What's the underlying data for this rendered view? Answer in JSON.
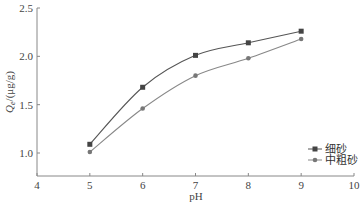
{
  "chart_data": {
    "type": "line",
    "title": "",
    "xlabel": "pH",
    "ylabel": "Q_e/(μg/g)",
    "xlim": [
      4,
      10
    ],
    "ylim": [
      0.75,
      2.5
    ],
    "xticks": [
      4,
      5,
      6,
      7,
      8,
      9,
      10
    ],
    "yticks": [
      1.0,
      1.5,
      2.0,
      2.5
    ],
    "xtick_labels": [
      "4",
      "5",
      "6",
      "7",
      "8",
      "9",
      "10"
    ],
    "ytick_labels": [
      "1.0",
      "1.5",
      "2.0",
      "2.5"
    ],
    "grid": false,
    "legend_position": "lower right",
    "x": [
      5,
      6,
      7,
      8,
      9
    ],
    "series": [
      {
        "name": "细砂",
        "marker": "square",
        "color": "#555555",
        "values": [
          1.09,
          1.68,
          2.01,
          2.14,
          2.26
        ]
      },
      {
        "name": "中粗砂",
        "marker": "circle",
        "color": "#888888",
        "values": [
          1.01,
          1.46,
          1.8,
          1.98,
          2.18
        ]
      }
    ]
  }
}
